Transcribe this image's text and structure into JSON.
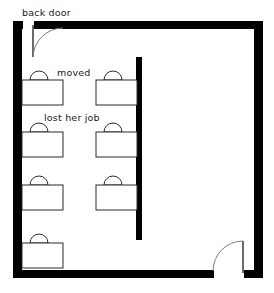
{
  "diagram": {
    "type": "floor-plan",
    "canvas": {
      "width": 274,
      "height": 293,
      "background": "#ffffff"
    },
    "colors": {
      "wall": "#000000",
      "furniture_stroke": "#2b2b2b",
      "furniture_fill": "#ffffff",
      "door_swing": "#7d7d7d",
      "text": "#1a1a1a"
    }
  },
  "labels": {
    "back_door": "back door",
    "moved": "moved",
    "lost_her_job": "lost her job"
  },
  "walls": {
    "outer": {
      "left": {
        "x": 13,
        "y": 21,
        "width": 9,
        "height": 257
      },
      "top": {
        "x": 13,
        "y": 21,
        "width": 250,
        "height": 8
      },
      "right": {
        "x": 254,
        "y": 21,
        "width": 9,
        "height": 257
      },
      "bottom": {
        "x": 13,
        "y": 270,
        "width": 250,
        "height": 8
      }
    },
    "interior_divider": {
      "x": 136,
      "y": 57,
      "width": 6,
      "height": 183
    }
  },
  "doors": [
    {
      "name": "back-door",
      "position": "top-left",
      "leaf": {
        "x1": 33,
        "y1": 26,
        "x2": 33,
        "y2": 57
      },
      "swing_end": {
        "x": 62,
        "y": 29
      }
    },
    {
      "name": "front-door",
      "position": "bottom-right",
      "leaf": {
        "x1": 243,
        "y1": 241,
        "x2": 243,
        "y2": 272
      },
      "swing_end": {
        "x": 214,
        "y": 272
      }
    }
  ],
  "workstations": [
    {
      "id": "ws-1",
      "column": "left",
      "row": 1,
      "desk": {
        "x": 22,
        "y": 80,
        "width": 41,
        "height": 25
      },
      "chair": {
        "cx": 39,
        "cy": 80,
        "r": 9
      },
      "note_key": "moved"
    },
    {
      "id": "ws-2",
      "column": "right",
      "row": 1,
      "desk": {
        "x": 96,
        "y": 80,
        "width": 41,
        "height": 25
      },
      "chair": {
        "cx": 113,
        "cy": 80,
        "r": 9
      },
      "note_key": null
    },
    {
      "id": "ws-3",
      "column": "left",
      "row": 2,
      "desk": {
        "x": 22,
        "y": 132,
        "width": 41,
        "height": 25
      },
      "chair": {
        "cx": 39,
        "cy": 132,
        "r": 9
      },
      "note_key": "lost_her_job"
    },
    {
      "id": "ws-4",
      "column": "right",
      "row": 2,
      "desk": {
        "x": 96,
        "y": 132,
        "width": 41,
        "height": 25
      },
      "chair": {
        "cx": 113,
        "cy": 132,
        "r": 9
      },
      "note_key": null
    },
    {
      "id": "ws-5",
      "column": "left",
      "row": 3,
      "desk": {
        "x": 22,
        "y": 185,
        "width": 41,
        "height": 25
      },
      "chair": {
        "cx": 39,
        "cy": 185,
        "r": 9
      },
      "note_key": null
    },
    {
      "id": "ws-6",
      "column": "right",
      "row": 3,
      "desk": {
        "x": 96,
        "y": 185,
        "width": 41,
        "height": 25
      },
      "chair": {
        "cx": 113,
        "cy": 185,
        "r": 9
      },
      "note_key": null
    },
    {
      "id": "ws-7",
      "column": "left",
      "row": 4,
      "desk": {
        "x": 22,
        "y": 243,
        "width": 41,
        "height": 25
      },
      "chair": {
        "cx": 39,
        "cy": 243,
        "r": 9
      },
      "note_key": null
    }
  ],
  "annotations": [
    {
      "id": "ann-back-door",
      "text_key": "back_door",
      "x": 22,
      "y": 15,
      "leader_to": {
        "x": 55,
        "y": 30
      }
    },
    {
      "id": "ann-moved",
      "text_key": "moved",
      "x": 57,
      "y": 77,
      "leader_to": null
    },
    {
      "id": "ann-lost-her-job",
      "text_key": "lost_her_job",
      "x": 44,
      "y": 120,
      "leader_to": null
    }
  ]
}
